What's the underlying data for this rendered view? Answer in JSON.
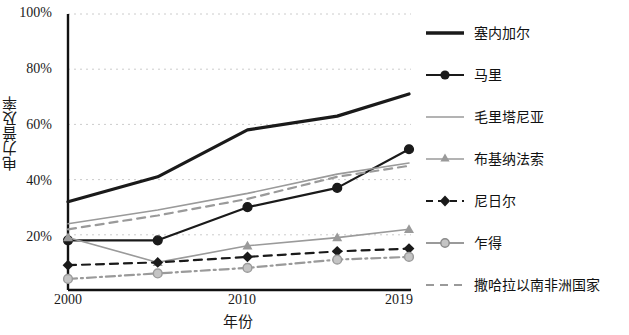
{
  "chart_data": {
    "type": "line",
    "title": "",
    "xlabel": "年份",
    "ylabel": "电力普及率",
    "x": [
      2000,
      2005,
      2010,
      2015,
      2019
    ],
    "xtick_labels": [
      "2000",
      "2010",
      "2019"
    ],
    "xtick_values": [
      2000,
      2010,
      2019
    ],
    "ytick_labels": [
      "20%",
      "40%",
      "60%",
      "80%",
      "100%"
    ],
    "ytick_values": [
      20,
      40,
      60,
      80,
      100
    ],
    "ylim": [
      0,
      100
    ],
    "xlim": [
      2000,
      2019
    ],
    "grid": true,
    "legend_position": "right",
    "series": [
      {
        "name": "塞内加尔",
        "color": "#1a1a1a",
        "style": "solid-thick",
        "marker": "none",
        "values": [
          32,
          41,
          58,
          63,
          71
        ]
      },
      {
        "name": "马里",
        "color": "#1a1a1a",
        "style": "solid",
        "marker": "circle",
        "values": [
          18,
          18,
          30,
          37,
          51
        ]
      },
      {
        "name": "毛里塔尼亚",
        "color": "#9a9a9a",
        "style": "solid-thin",
        "marker": "none",
        "values": [
          24,
          29,
          35,
          42,
          46
        ]
      },
      {
        "name": "布基纳法索",
        "color": "#9a9a9a",
        "style": "solid-thin",
        "marker": "triangle",
        "values": [
          19,
          10,
          16,
          19,
          22
        ]
      },
      {
        "name": "尼日尔",
        "color": "#1a1a1a",
        "style": "dashed",
        "marker": "diamond",
        "values": [
          9,
          10,
          12,
          14,
          15
        ]
      },
      {
        "name": "乍得",
        "color": "#9a9a9a",
        "style": "dashdot",
        "marker": "circle",
        "values": [
          4,
          6,
          8,
          11,
          12
        ]
      },
      {
        "name": "撒哈拉以南非洲国家",
        "color": "#9a9a9a",
        "style": "dashed",
        "marker": "none",
        "values": [
          22,
          27,
          33,
          41,
          45
        ]
      }
    ]
  },
  "axes": {
    "ylabel": "电力普及率",
    "xlabel": "年份",
    "yticks": [
      "100%",
      "80%",
      "60%",
      "40%",
      "20%"
    ],
    "xticks": [
      "2000",
      "2010",
      "2019"
    ]
  },
  "legend": {
    "items": [
      {
        "label": "塞内加尔"
      },
      {
        "label": "马里"
      },
      {
        "label": "毛里塔尼亚"
      },
      {
        "label": "布基纳法索"
      },
      {
        "label": "尼日尔"
      },
      {
        "label": "乍得"
      },
      {
        "label": "撒哈拉以南非洲国家"
      }
    ]
  },
  "colors": {
    "dark": "#1a1a1a",
    "gray": "#9a9a9a",
    "grid": "#cccccc",
    "background": "#ffffff"
  }
}
